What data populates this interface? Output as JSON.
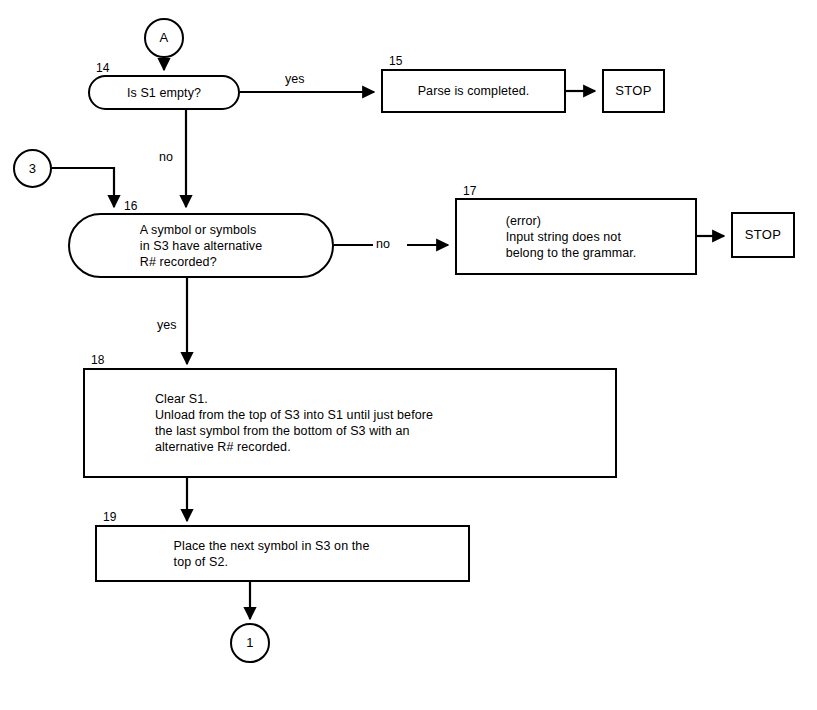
{
  "diagram": {
    "ink_color": "#000000",
    "background_color": "#ffffff"
  },
  "connectors": {
    "entry_a": "A",
    "entry_3": "3",
    "exit_1": "1"
  },
  "nodes": {
    "n14": {
      "number": "14",
      "text": "Is S1 empty?",
      "shape": "stadium"
    },
    "n15": {
      "number": "15",
      "text": "Parse is completed.",
      "shape": "rect"
    },
    "n16": {
      "number": "16",
      "text": "A symbol or symbols\nin S3 have alternative\nR# recorded?",
      "shape": "stadium"
    },
    "n17": {
      "number": "17",
      "text": "(error)\nInput string does not\nbelong to the grammar.",
      "shape": "rect"
    },
    "n18": {
      "number": "18",
      "text": "Clear S1.\nUnload from the top of S3 into S1 until just before\nthe last symbol from the bottom of S3 with an\nalternative R# recorded.",
      "shape": "rect"
    },
    "n19": {
      "number": "19",
      "text": "Place the next symbol in S3 on the\ntop of S2.",
      "shape": "rect"
    },
    "stop_top": {
      "text": "STOP",
      "shape": "rect"
    },
    "stop_mid": {
      "text": "STOP",
      "shape": "rect"
    }
  },
  "edge_labels": {
    "n14_yes": "yes",
    "n14_no": "no",
    "n16_no": "no",
    "n16_yes": "yes"
  }
}
